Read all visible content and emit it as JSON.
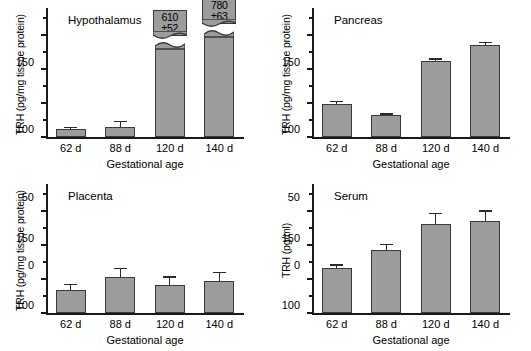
{
  "figure": {
    "shared_xlabel": "Gestational age",
    "categories": [
      "62 d",
      "88 d",
      "120 d",
      "140 d"
    ]
  },
  "chart_data": [
    {
      "type": "bar",
      "title": "Hypothalamus",
      "panel_id": "hypothalamus",
      "xlabel": "Gestational age",
      "ylabel": "TRH (pg/mg tissue protein)",
      "categories": [
        "62 d",
        "88 d",
        "120 d",
        "140 d"
      ],
      "values": [
        12,
        15,
        610,
        780
      ],
      "errors": [
        3,
        9,
        52,
        63
      ],
      "displayed_values": [
        12,
        15,
        132,
        150
      ],
      "ylim": [
        0,
        190
      ],
      "yticks": [
        0,
        50,
        100,
        150
      ],
      "ytick_labels": [
        "0",
        "50",
        "100",
        "150"
      ],
      "minor_yticks": [
        25,
        75,
        125,
        175
      ],
      "grid": false,
      "legend": "none",
      "axis_break": true,
      "annotations": [
        {
          "category": "120 d",
          "line1": "610",
          "line2": "±52"
        },
        {
          "category": "140 d",
          "line1": "780",
          "line2": "±63"
        }
      ]
    },
    {
      "type": "bar",
      "title": "Pancreas",
      "panel_id": "pancreas",
      "xlabel": "Gestational age",
      "ylabel": "TRH (pg/mg tissue protein)",
      "categories": [
        "62 d",
        "88 d",
        "120 d",
        "140 d"
      ],
      "values": [
        49,
        32,
        112,
        136
      ],
      "errors": [
        4,
        3,
        4,
        4
      ],
      "ylim": [
        0,
        190
      ],
      "yticks": [
        0,
        50,
        100,
        150
      ],
      "ytick_labels": [
        "0",
        "50",
        "100",
        "150"
      ],
      "minor_yticks": [
        25,
        75,
        125,
        175
      ],
      "grid": false,
      "legend": "none"
    },
    {
      "type": "bar",
      "title": "Placenta",
      "panel_id": "placenta",
      "xlabel": "Gestational age",
      "ylabel": "TRH (pg/mg tissue protein)",
      "categories": [
        "62 d",
        "88 d",
        "120 d",
        "140 d"
      ],
      "values": [
        34,
        53,
        41,
        47
      ],
      "errors": [
        9,
        14,
        13,
        14
      ],
      "ylim": [
        0,
        190
      ],
      "yticks": [
        0,
        50,
        100,
        150
      ],
      "ytick_labels": [
        "0",
        "50",
        "100",
        "150"
      ],
      "minor_yticks": [
        25,
        75,
        125,
        175
      ],
      "grid": false,
      "legend": "none"
    },
    {
      "type": "bar",
      "title": "Serum",
      "panel_id": "serum",
      "xlabel": "Gestational age",
      "ylabel": "TRH (pg/ml)",
      "categories": [
        "62 d",
        "88 d",
        "120 d",
        "140 d"
      ],
      "values": [
        67,
        93,
        131,
        136
      ],
      "errors": [
        5,
        9,
        17,
        15
      ],
      "ylim": [
        0,
        190
      ],
      "yticks": [
        0,
        50,
        100,
        150
      ],
      "ytick_labels": [
        "0",
        "50",
        "100",
        "150"
      ],
      "minor_yticks": [
        25,
        75,
        125,
        175
      ],
      "grid": false,
      "legend": "none"
    }
  ],
  "style": {
    "bar_fill": "#9c9c9c",
    "bar_stroke": "#3a3a3a",
    "axis_color": "#1a1a1a",
    "background": "#ffffff"
  }
}
